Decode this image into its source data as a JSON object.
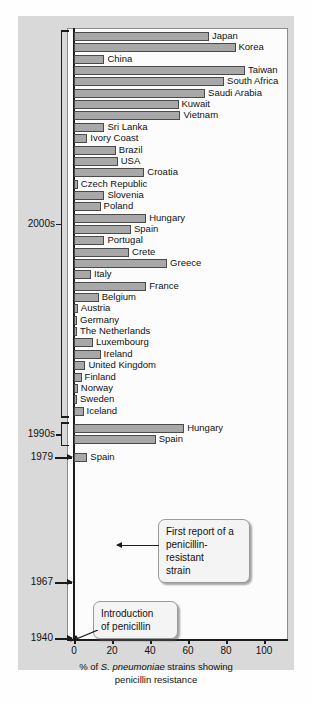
{
  "chart_data": {
    "type": "bar",
    "orientation": "horizontal",
    "title": "",
    "xlabel": "% of S. pneumoniae strains showing penicillin resistance",
    "ylabel": "",
    "xlim": [
      0,
      115
    ],
    "xticks": [
      0,
      20,
      40,
      60,
      80,
      100
    ],
    "xticklabels": [
      "0",
      "20",
      "40",
      "60",
      "80",
      "100"
    ],
    "grid": false,
    "legend": null,
    "bar_color": "#a8a8a8",
    "bar_edge_color": "#4a4a4a",
    "groups": [
      {
        "period": "2000s",
        "categories": [
          "Japan",
          "Korea",
          "China",
          "Taiwan",
          "South Africa",
          "Saudi Arabia",
          "Kuwait",
          "Vietnam",
          "Sri Lanka",
          "Ivory Coast",
          "Brazil",
          "USA",
          "Croatia",
          "Czech Republic",
          "Slovenia",
          "Poland",
          "Hungary",
          "Spain",
          "Portugal",
          "Crete",
          "Greece",
          "Italy",
          "France",
          "Belgium",
          "Austria",
          "Germany",
          "The Netherlands",
          "Luxembourg",
          "Ireland",
          "United Kingdom",
          "Finland",
          "Norway",
          "Sweden",
          "Iceland"
        ],
        "values": [
          71,
          85,
          16,
          90,
          79,
          69,
          55,
          56,
          16,
          7,
          22,
          23,
          37,
          2,
          16,
          14,
          38,
          30,
          16,
          29,
          49,
          9,
          38,
          13,
          2,
          1,
          1,
          10,
          14,
          6,
          4,
          2,
          1,
          5
        ]
      },
      {
        "period": "1990s",
        "categories": [
          "Hungary",
          "Spain"
        ],
        "values": [
          58,
          43
        ]
      },
      {
        "period": "1979",
        "categories": [
          "Spain"
        ],
        "values": [
          7
        ]
      },
      {
        "period": "1967",
        "categories": [],
        "values": []
      },
      {
        "period": "1940",
        "categories": [],
        "values": []
      }
    ],
    "annotations": [
      {
        "id": "first-report",
        "text": "First report of a penicillin-resistant strain",
        "lines": [
          "First report of a",
          "penicillin-resistant",
          "strain"
        ],
        "points_to": "1979 Spain bar"
      },
      {
        "id": "introduction",
        "text": "Introduction of penicillin",
        "lines": [
          "Introduction",
          "of penicillin"
        ],
        "points_to": "1940 origin"
      }
    ]
  },
  "axis": {
    "years": [
      {
        "label": "2000s",
        "kind": "bracket"
      },
      {
        "label": "1990s",
        "kind": "bracket"
      },
      {
        "label": "1979",
        "kind": "arrow"
      },
      {
        "label": "1967",
        "kind": "arrow"
      },
      {
        "label": "1940",
        "kind": "arrow"
      }
    ],
    "x_title_line1_pre": "% of ",
    "x_title_italic": "S. pneumoniae",
    "x_title_line1_post": " strains showing",
    "x_title_line2": "penicillin resistance"
  },
  "colors": {
    "bar_fill": "#a8a8a8",
    "bar_stroke": "#4a4a4a",
    "panel_bg": "#fcfcfc",
    "card_bg": "#d9d9d9",
    "ink": "#111111"
  }
}
